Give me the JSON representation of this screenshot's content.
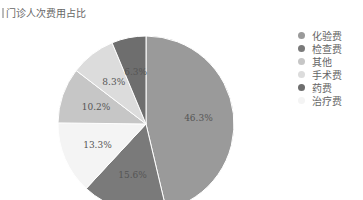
{
  "title": "门诊人次费用占比",
  "chart_data": {
    "type": "pie",
    "title": "门诊人次费用占比",
    "categories": [
      "化验费",
      "检查费",
      "治疗费",
      "其他",
      "手术费",
      "药费"
    ],
    "values": [
      46.3,
      15.6,
      13.3,
      10.2,
      8.3,
      6.3
    ],
    "labels": [
      "46.3%",
      "15.6%",
      "13.3%",
      "10.2%",
      "8.3%",
      "6.3%"
    ],
    "colors": [
      "#9a9a9a",
      "#7a7a7a",
      "#f4f4f4",
      "#c6c6c6",
      "#dcdcdc",
      "#6e6e6e"
    ],
    "legend_position": "right",
    "legend": [
      {
        "label": "化验费",
        "color": "#9a9a9a"
      },
      {
        "label": "检查费",
        "color": "#7a7a7a"
      },
      {
        "label": "其他",
        "color": "#c6c6c6"
      },
      {
        "label": "手术费",
        "color": "#dcdcdc"
      },
      {
        "label": "药费",
        "color": "#6e6e6e"
      },
      {
        "label": "治疗费",
        "color": "#f4f4f4"
      }
    ]
  }
}
